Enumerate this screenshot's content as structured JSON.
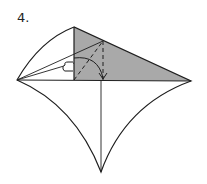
{
  "step": {
    "label": "4."
  },
  "diagram": {
    "type": "origami-fold-step",
    "shaded_color": "#a9a9a9",
    "line_color": "#1e1e1e",
    "arrow": "fold-and-unfold",
    "symbol": "repeat-behind"
  }
}
